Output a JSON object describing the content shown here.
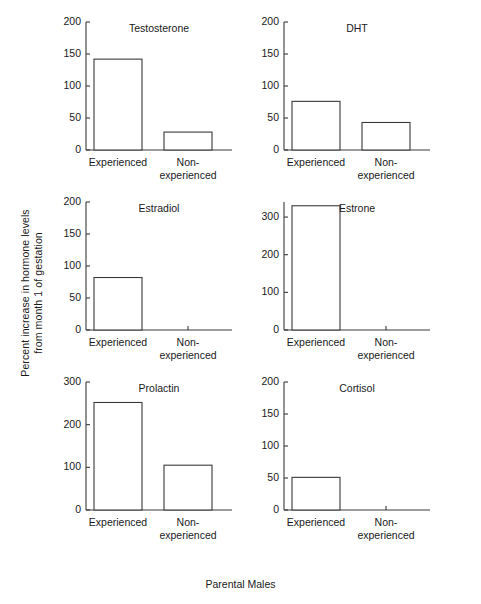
{
  "figure": {
    "ylabel_line1": "Percent increase in hormone levels",
    "ylabel_line2": "from month 1 of gestation",
    "xlabel": "Parental Males",
    "categories": [
      "Experienced",
      "Non-experienced"
    ],
    "cat1": "Experienced",
    "cat2_line1": "Non-",
    "cat2_line2": "experienced"
  },
  "chart_data": {
    "type": "bar",
    "title": "",
    "xlabel": "Parental Males",
    "ylabel": "Percent increase in hormone levels from month 1 of gestation",
    "categories": [
      "Experienced",
      "Non-experienced"
    ],
    "grid": false,
    "legend": "none",
    "panels": [
      {
        "title": "Testosterone",
        "values": [
          142,
          28
        ],
        "ylim": [
          0,
          200
        ],
        "yticks": [
          0,
          50,
          100,
          150,
          200
        ],
        "ytick_labels": [
          "0",
          "50",
          "100",
          "150",
          "200"
        ]
      },
      {
        "title": "DHT",
        "values": [
          76,
          43
        ],
        "ylim": [
          0,
          200
        ],
        "yticks": [
          0,
          50,
          100,
          150,
          200
        ],
        "ytick_labels": [
          "0",
          "50",
          "100",
          "150",
          "200"
        ]
      },
      {
        "title": "Estradiol",
        "values": [
          82,
          0
        ],
        "ylim": [
          0,
          200
        ],
        "yticks": [
          0,
          50,
          100,
          150,
          200
        ],
        "ytick_labels": [
          "0",
          "50",
          "100",
          "150",
          "200"
        ]
      },
      {
        "title": "Estrone",
        "values": [
          330,
          0
        ],
        "ylim": [
          0,
          340
        ],
        "yticks": [
          0,
          100,
          200,
          300
        ],
        "ytick_labels": [
          "0",
          "100",
          "200",
          "300"
        ]
      },
      {
        "title": "Prolactin",
        "values": [
          252,
          105
        ],
        "ylim": [
          0,
          300
        ],
        "yticks": [
          0,
          100,
          200,
          300
        ],
        "ytick_labels": [
          "0",
          "100",
          "200",
          "300"
        ]
      },
      {
        "title": "Cortisol",
        "values": [
          51,
          0
        ],
        "ylim": [
          0,
          200
        ],
        "yticks": [
          0,
          50,
          100,
          150,
          200
        ],
        "ytick_labels": [
          "0",
          "50",
          "100",
          "150",
          "200"
        ]
      }
    ]
  },
  "layout": {
    "panel_origins": [
      {
        "x": 60,
        "y": 22
      },
      {
        "x": 258,
        "y": 22
      },
      {
        "x": 60,
        "y": 202
      },
      {
        "x": 258,
        "y": 202
      },
      {
        "x": 60,
        "y": 382
      },
      {
        "x": 258,
        "y": 382
      }
    ],
    "plot_width": 175,
    "plot_height": 128,
    "axis_left": 26,
    "bar1_x": 34,
    "bar2_x": 104,
    "bar_width": 48,
    "axis_right": 172
  }
}
